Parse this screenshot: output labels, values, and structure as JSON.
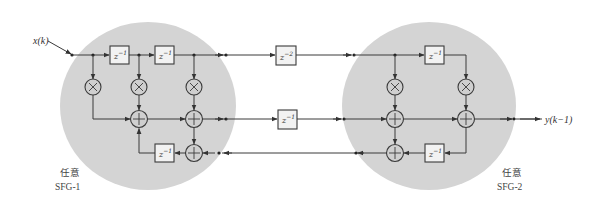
{
  "diagram": {
    "type": "signal-flow-graph",
    "input_label": "x(k)",
    "output_label": "y(k−1)",
    "regions": [
      {
        "id": "SFG-1",
        "caption_cn": "任意",
        "caption_en": "SFG-1",
        "color": "#d4d4d4"
      },
      {
        "id": "SFG-2",
        "caption_cn": "任意",
        "caption_en": "SFG-2",
        "color": "#d4d4d4"
      }
    ],
    "delays": {
      "sfg1_top_1": {
        "base": "z",
        "exp": "−1"
      },
      "sfg1_top_2": {
        "base": "z",
        "exp": "−1"
      },
      "sfg1_bottom": {
        "base": "z",
        "exp": "−1"
      },
      "mid_top": {
        "base": "z",
        "exp": "−2"
      },
      "mid_middle": {
        "base": "z",
        "exp": "−1"
      },
      "sfg2_top": {
        "base": "z",
        "exp": "−1"
      },
      "sfg2_bottom": {
        "base": "z",
        "exp": "−1"
      }
    },
    "operators": {
      "multiplier_symbol": "×",
      "adder_symbol": "+",
      "multipliers_count": 5,
      "adders_count": 6
    }
  }
}
